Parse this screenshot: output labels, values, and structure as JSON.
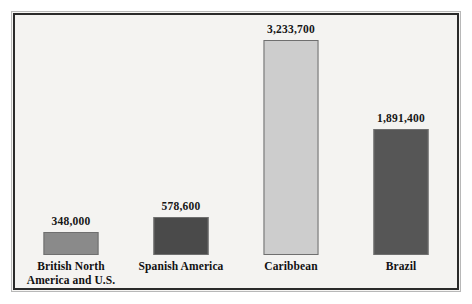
{
  "chart_data": {
    "type": "bar",
    "title": "",
    "subtitle": "",
    "xlabel": "",
    "ylabel": "",
    "ylim": [
      0,
      3233700
    ],
    "grid": false,
    "legend": null,
    "value_label_format": "comma-separated integers shown above each bar",
    "categories": [
      "British North America and U.S.",
      "Spanish America",
      "Caribbean",
      "Brazil"
    ],
    "values": [
      348000,
      578600,
      3233700,
      1891400
    ],
    "value_labels": [
      "348,000",
      "578,600",
      "3,233,700",
      "1,891,400"
    ],
    "bars": [
      {
        "category": "British North America and U.S.",
        "label_lines": [
          "British North",
          "America and U.S."
        ],
        "value": 348000,
        "value_label": "348,000",
        "color": "#8a8a8a"
      },
      {
        "category": "Spanish America",
        "label_lines": [
          "Spanish America"
        ],
        "value": 578600,
        "value_label": "578,600",
        "color": "#4a4a4a"
      },
      {
        "category": "Caribbean",
        "label_lines": [
          "Caribbean"
        ],
        "value": 3233700,
        "value_label": "3,233,700",
        "color": "#cdcdcd"
      },
      {
        "category": "Brazil",
        "label_lines": [
          "Brazil"
        ],
        "value": 1891400,
        "value_label": "1,891,400",
        "color": "#565656"
      }
    ]
  },
  "figure": {
    "background_color": "#f4f3f1",
    "frame_color": "#2a2a2a",
    "text_color": "#111111"
  }
}
